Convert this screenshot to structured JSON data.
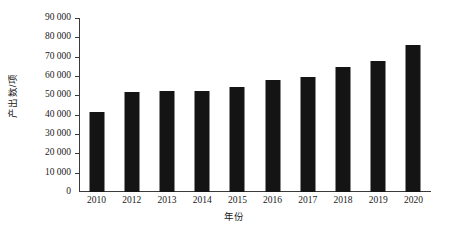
{
  "chart_data": {
    "type": "bar",
    "title": "",
    "subtitle": "",
    "xlabel": "年份",
    "ylabel": "产出数/项",
    "categories": [
      "2010",
      "2012",
      "2013",
      "2014",
      "2015",
      "2016",
      "2017",
      "2018",
      "2019",
      "2020"
    ],
    "values": [
      41500,
      51500,
      52000,
      52500,
      54500,
      58000,
      59500,
      64500,
      68000,
      76000
    ],
    "ylim": [
      0,
      90000
    ],
    "ytick_step": 10000,
    "ytick_labels": [
      "0",
      "10 000",
      "20 000",
      "30 000",
      "40 000",
      "50 000",
      "60 000",
      "70 000",
      "80 000",
      "90 000"
    ],
    "ytick_values": [
      0,
      10000,
      20000,
      30000,
      40000,
      50000,
      60000,
      70000,
      80000,
      90000
    ],
    "grid": false,
    "legend": false,
    "legend_position": "none",
    "bar_color": "#141414",
    "axis_color": "#3a3a3a",
    "background_color": "#ffffff",
    "annotations": []
  }
}
